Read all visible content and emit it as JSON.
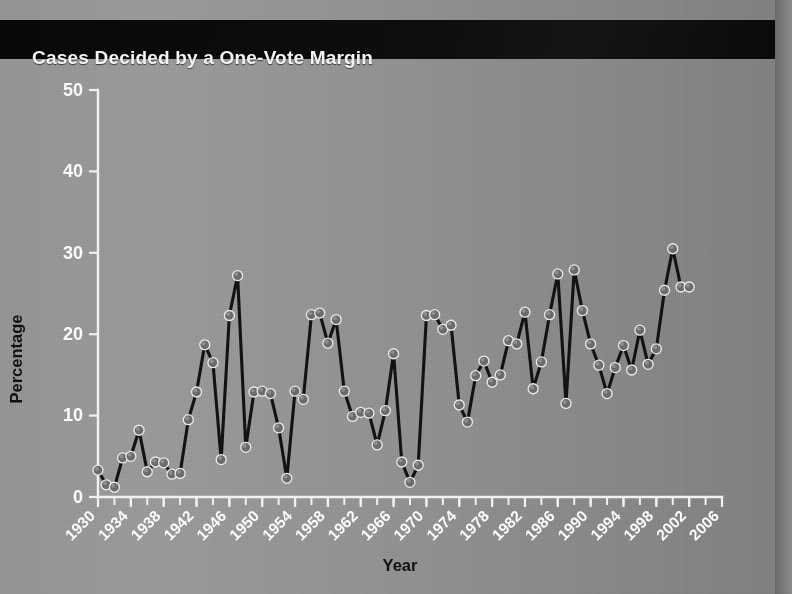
{
  "title": "Cases Decided by a One-Vote Margin",
  "colors": {
    "titlebar_background": "#0a0a0a",
    "title_text": "#f4f4f4",
    "page_background": "#8d8d8d",
    "axis": "#f2f2f2",
    "tick_label": "#fcfcfc",
    "axis_title": "#101010",
    "line": "#121212",
    "marker_fill": "#6b6b6b",
    "marker_edge": "#ededed"
  },
  "chart_data": {
    "type": "line",
    "title": "Cases Decided by a One-Vote Margin",
    "xlabel": "Year",
    "ylabel": "Percentage",
    "xlim": [
      1930,
      2006
    ],
    "ylim": [
      0,
      50
    ],
    "ytick_values": [
      0,
      10,
      20,
      30,
      40,
      50
    ],
    "ytick_labels": [
      "0",
      "10",
      "20",
      "30",
      "40",
      "50"
    ],
    "xtick_labels": [
      "1930",
      "1934",
      "1938",
      "1942",
      "1946",
      "1950",
      "1954",
      "1958",
      "1962",
      "1966",
      "1970",
      "1974",
      "1978",
      "1982",
      "1986",
      "1990",
      "1994",
      "1998",
      "2002",
      "2006"
    ],
    "xtick_values": [
      1930,
      1934,
      1938,
      1942,
      1946,
      1950,
      1954,
      1958,
      1962,
      1966,
      1970,
      1974,
      1978,
      1982,
      1986,
      1990,
      1994,
      1998,
      2002,
      2006
    ],
    "xtick_label_rotation": 45,
    "xtick_minor_step": 2,
    "grid": false,
    "legend": false,
    "marker": "circle",
    "x": [
      1930,
      1931,
      1932,
      1933,
      1934,
      1935,
      1936,
      1937,
      1938,
      1939,
      1940,
      1941,
      1942,
      1943,
      1944,
      1945,
      1946,
      1947,
      1948,
      1949,
      1950,
      1951,
      1952,
      1953,
      1954,
      1955,
      1956,
      1957,
      1958,
      1959,
      1960,
      1961,
      1962,
      1963,
      1964,
      1965,
      1966,
      1967,
      1968,
      1969,
      1970,
      1971,
      1972,
      1973,
      1974,
      1975,
      1976,
      1977,
      1978,
      1979,
      1980,
      1981,
      1982,
      1983,
      1984,
      1985,
      1986,
      1987,
      1988,
      1989,
      1990,
      1991,
      1992,
      1993,
      1994,
      1995,
      1996,
      1997,
      1998,
      1999,
      2000,
      2001,
      2002
    ],
    "y": [
      3.3,
      1.5,
      1.2,
      4.8,
      5.0,
      8.2,
      3.1,
      4.3,
      4.2,
      2.8,
      2.9,
      9.5,
      12.9,
      18.7,
      16.5,
      4.6,
      22.3,
      27.2,
      6.1,
      12.9,
      13.0,
      12.7,
      8.5,
      2.3,
      13.0,
      12.0,
      22.4,
      22.6,
      18.9,
      21.8,
      13.0,
      9.9,
      10.4,
      10.3,
      6.4,
      10.6,
      17.6,
      4.3,
      1.8,
      3.9,
      22.3,
      22.4,
      20.6,
      21.1,
      11.3,
      9.2,
      14.9,
      16.7,
      14.1,
      15.0,
      19.2,
      18.8,
      22.7,
      13.3,
      16.6,
      22.4,
      27.4,
      11.5,
      27.9,
      22.9,
      18.8,
      16.2,
      12.7,
      15.9,
      18.6,
      15.6,
      20.5,
      16.3,
      18.2,
      25.4,
      30.5,
      25.8,
      25.8
    ]
  }
}
